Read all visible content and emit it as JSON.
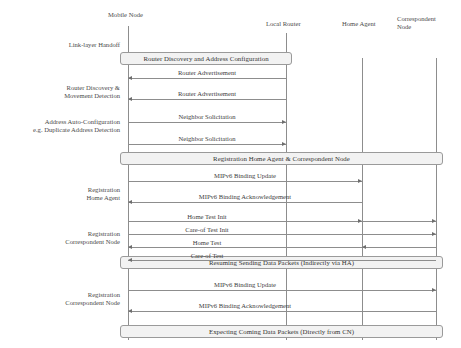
{
  "diagram": {
    "type": "sequence-diagram",
    "colors": {
      "line": "#8d8d8d",
      "box_fill": "#f2f2f2",
      "box_border": "#9a9a9a",
      "text": "#3a3a3a"
    },
    "lifelines": [
      {
        "id": "mn",
        "label": "Mobile Node",
        "x": 128,
        "head_x": 108,
        "head_y": 11,
        "top": 26,
        "bottom": 340
      },
      {
        "id": "lr",
        "label": "Local Router",
        "x": 286,
        "head_x": 266,
        "head_y": 20,
        "top": 33,
        "bottom": 340
      },
      {
        "id": "ha",
        "label": "Home Agent",
        "x": 362,
        "head_x": 342,
        "head_y": 20,
        "top": 58,
        "bottom": 340
      },
      {
        "id": "cn",
        "label": "Correspondent\nNode",
        "x": 436,
        "head_x": 397,
        "head_y": 15,
        "top": 58,
        "bottom": 340
      }
    ],
    "phase_boxes": [
      {
        "id": "box-router-discovery",
        "label": "Router Discovery and Address Configuration",
        "x": 120,
        "y": 52,
        "width": 172,
        "height": 13
      },
      {
        "id": "box-registration-ha-cn",
        "label": "Registration Home Agent & Correspondent Node",
        "x": 120,
        "y": 152,
        "width": 323,
        "height": 13
      },
      {
        "id": "box-resuming-data",
        "label": "Resuming Sending Data Packets (Indirectly via HA)",
        "x": 120,
        "y": 256,
        "width": 323,
        "height": 13
      },
      {
        "id": "box-expecting-data",
        "label": "Expecting Coming Data Packets (Directly from CN)",
        "x": 120,
        "y": 325,
        "width": 323,
        "height": 13
      }
    ],
    "messages": [
      {
        "id": "msg-router-advertisement-1",
        "label": "Router Advertisement",
        "from_x": 286,
        "to_x": 128,
        "y": 78,
        "direction": "left",
        "label_x": 207,
        "label_y": 69
      },
      {
        "id": "msg-router-advertisement-2",
        "label": "Router Advertisement",
        "from_x": 286,
        "to_x": 128,
        "y": 99,
        "direction": "left",
        "label_x": 207,
        "label_y": 90
      },
      {
        "id": "msg-neighbor-solicitation-1",
        "label": "Neighbor Solicitation",
        "from_x": 128,
        "to_x": 286,
        "y": 122,
        "direction": "right",
        "label_x": 207,
        "label_y": 113
      },
      {
        "id": "msg-neighbor-solicitation-2",
        "label": "Neighbor Solicitation",
        "from_x": 128,
        "to_x": 286,
        "y": 144,
        "direction": "right",
        "label_x": 207,
        "label_y": 135
      },
      {
        "id": "msg-binding-update-ha",
        "label": "MIPv6 Binding Update",
        "from_x": 128,
        "to_x": 362,
        "y": 181,
        "direction": "right",
        "label_x": 245,
        "label_y": 172
      },
      {
        "id": "msg-binding-ack-ha",
        "label": "MIPv6 Binding Acknowledgement",
        "from_x": 362,
        "to_x": 128,
        "y": 202,
        "direction": "left",
        "label_x": 245,
        "label_y": 193
      },
      {
        "id": "msg-home-test-init",
        "label": "Home Test Init",
        "from_x": 128,
        "to_x": 436,
        "y": 221,
        "direction": "right",
        "label_x": 207,
        "label_y": 213,
        "extra_arrow_x": 362
      },
      {
        "id": "msg-care-of-test-init",
        "label": "Care-of Test Init",
        "from_x": 128,
        "to_x": 436,
        "y": 234,
        "direction": "right",
        "label_x": 207,
        "label_y": 226
      },
      {
        "id": "msg-home-test",
        "label": "Home Test",
        "from_x": 436,
        "to_x": 128,
        "y": 247,
        "direction": "left",
        "label_x": 207,
        "label_y": 239,
        "extra_arrow_x": 362
      },
      {
        "id": "msg-care-of-test",
        "label": "Care-of Test",
        "from_x": 436,
        "to_x": 128,
        "y": 260,
        "direction": "left",
        "label_x": 207,
        "label_y": 252
      },
      {
        "id": "msg-binding-update-cn",
        "label": "MIPv6 Binding Update",
        "from_x": 128,
        "to_x": 436,
        "y": 290,
        "direction": "right",
        "label_x": 245,
        "label_y": 281
      },
      {
        "id": "msg-binding-ack-cn",
        "label": "MIPv6 Binding Acknowledgement",
        "from_x": 436,
        "to_x": 128,
        "y": 311,
        "direction": "left",
        "label_x": 245,
        "label_y": 302
      }
    ],
    "side_labels": [
      {
        "id": "label-link-layer-handoff",
        "text": "Link-layer Handoff",
        "x": 8,
        "y": 41,
        "width": 112
      },
      {
        "id": "label-router-discovery",
        "text": "Router Discovery &\nMovement Detection",
        "x": 8,
        "y": 84,
        "width": 112
      },
      {
        "id": "label-address-autoconfig",
        "text": "Address Auto-Configuration\ne.g. Duplicate Address Detection",
        "x": 4,
        "y": 118,
        "width": 116
      },
      {
        "id": "label-registration-home-agent",
        "text": "Registration\nHome Agent",
        "x": 8,
        "y": 186,
        "width": 112
      },
      {
        "id": "label-registration-correspondent-node-1",
        "text": "Registration\nCorrespondent Node",
        "x": 8,
        "y": 230,
        "width": 112
      },
      {
        "id": "label-registration-correspondent-node-2",
        "text": "Registration\nCorrespondent Node",
        "x": 8,
        "y": 291,
        "width": 112
      }
    ]
  }
}
